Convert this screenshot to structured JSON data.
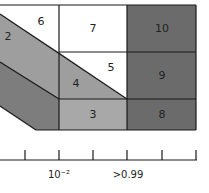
{
  "diagram": {
    "colors": {
      "white": "#ffffff",
      "light_gray": "#a6a6a6",
      "mid_gray": "#8c8c8c",
      "dark_gray": "#6b6b6b",
      "line": "#1a1a1a"
    },
    "regions": [
      {
        "id": "2",
        "label": "2",
        "fill": "#9e9e9e"
      },
      {
        "id": "3",
        "label": "3",
        "fill": "#a8a8a8"
      },
      {
        "id": "4",
        "label": "4",
        "fill": "#9e9e9e"
      },
      {
        "id": "5",
        "label": "5",
        "fill": "#ffffff"
      },
      {
        "id": "6",
        "label": "6",
        "fill": "#ffffff"
      },
      {
        "id": "7",
        "label": "7",
        "fill": "#ffffff"
      },
      {
        "id": "8",
        "label": "8",
        "fill": "#6b6b6b"
      },
      {
        "id": "9",
        "label": "9",
        "fill": "#6b6b6b"
      },
      {
        "id": "10",
        "label": "10",
        "fill": "#6b6b6b"
      },
      {
        "id": "1",
        "label": "",
        "fill": "#7d7d7d"
      }
    ],
    "axis": {
      "tick_count": 6,
      "labels": [
        {
          "text": "10⁻²",
          "position": "tick-2"
        },
        {
          "text": ">0.99",
          "position": "tick-4"
        }
      ]
    }
  }
}
